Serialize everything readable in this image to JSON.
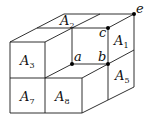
{
  "figure": {
    "type": "block-decomposition",
    "region_labels": [
      {
        "id": "A1",
        "base": "A",
        "sub": "1",
        "x": 114,
        "y": 45
      },
      {
        "id": "A2",
        "base": "A",
        "sub": "2",
        "x": 60,
        "y": 25
      },
      {
        "id": "A3",
        "base": "A",
        "sub": "3",
        "x": 20,
        "y": 65
      },
      {
        "id": "A5",
        "base": "A",
        "sub": "5",
        "x": 115,
        "y": 80
      },
      {
        "id": "A7",
        "base": "A",
        "sub": "7",
        "x": 20,
        "y": 101
      },
      {
        "id": "A8",
        "base": "A",
        "sub": "8",
        "x": 55,
        "y": 101
      }
    ],
    "points": [
      {
        "id": "a",
        "label": "a",
        "x": 72,
        "y": 64,
        "lx": 74,
        "ly": 61
      },
      {
        "id": "b",
        "label": "b",
        "x": 108,
        "y": 64,
        "lx": 98,
        "ly": 61
      },
      {
        "id": "c",
        "label": "c",
        "x": 108,
        "y": 28,
        "lx": 99,
        "ly": 37
      },
      {
        "id": "e",
        "label": "e",
        "x": 134,
        "y": 14,
        "lx": 136,
        "ly": 13
      }
    ],
    "colors": {
      "stroke": "#1a1a1a",
      "point": "#000000",
      "background": "#ffffff"
    }
  }
}
